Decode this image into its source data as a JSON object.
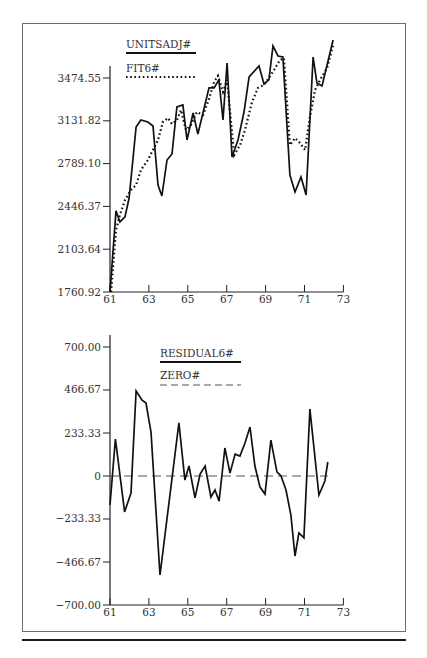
{
  "chart_data": [
    {
      "type": "line",
      "title": "",
      "xlabel": "",
      "ylabel": "",
      "xlim": [
        61,
        73
      ],
      "ylim": [
        1760.92,
        3817.28
      ],
      "grid": false,
      "legend_position": "top-left inside",
      "x_ticks": [
        "61",
        "63",
        "65",
        "67",
        "69",
        "71",
        "73"
      ],
      "y_ticks": [
        "1760.92",
        "2103.64",
        "2446.37",
        "2789.10",
        "3131.82",
        "3474.55"
      ],
      "series": [
        {
          "name": "UNITSADJ#",
          "style": "solid",
          "x": [
            61.0,
            61.31,
            61.51,
            61.77,
            61.98,
            62.34,
            62.59,
            62.95,
            63.21,
            63.47,
            63.67,
            63.93,
            64.19,
            64.44,
            64.75,
            64.96,
            65.27,
            65.52,
            66.09,
            66.35,
            66.6,
            66.81,
            67.02,
            67.27,
            67.58,
            67.89,
            68.15,
            68.66,
            68.92,
            69.17,
            69.38,
            69.64,
            69.89,
            70.25,
            70.51,
            70.82,
            71.08,
            71.44,
            71.64,
            71.9,
            72.47
          ],
          "values": [
            1761,
            2410,
            2322,
            2362,
            2514,
            3082,
            3138,
            3122,
            3090,
            2618,
            2530,
            2818,
            2866,
            3242,
            3258,
            2978,
            3194,
            3026,
            3395,
            3395,
            3459,
            3138,
            3595,
            2842,
            2978,
            3202,
            3483,
            3571,
            3427,
            3459,
            3731,
            3651,
            3643,
            2698,
            2562,
            2682,
            2538,
            3643,
            3435,
            3411,
            3779
          ]
        },
        {
          "name": "FIT6#",
          "style": "dotted",
          "x": [
            61.05,
            61.31,
            61.51,
            61.77,
            62.08,
            62.34,
            62.59,
            62.95,
            63.26,
            63.47,
            63.72,
            63.98,
            64.19,
            64.44,
            64.65,
            64.9,
            65.16,
            65.47,
            65.78,
            66.09,
            66.35,
            66.55,
            66.81,
            67.02,
            67.38,
            67.69,
            67.94,
            68.3,
            68.61,
            68.92,
            69.17,
            69.43,
            69.74,
            69.94,
            70.25,
            70.51,
            70.77,
            71.03,
            71.28,
            71.54,
            71.8,
            72.16,
            72.47
          ],
          "values": [
            1761,
            2258,
            2378,
            2498,
            2578,
            2618,
            2738,
            2818,
            2914,
            2978,
            3122,
            3154,
            3106,
            3138,
            3218,
            3058,
            3098,
            3202,
            3178,
            3306,
            3443,
            3491,
            3363,
            3459,
            2858,
            2938,
            3058,
            3282,
            3395,
            3419,
            3475,
            3539,
            3619,
            3635,
            2938,
            2994,
            2954,
            2898,
            3162,
            3378,
            3459,
            3555,
            3739
          ]
        }
      ]
    },
    {
      "type": "line",
      "title": "",
      "xlabel": "",
      "ylabel": "",
      "xlim": [
        61,
        73
      ],
      "ylim": [
        -700.0,
        700.0
      ],
      "grid": false,
      "legend_position": "top-center inside",
      "x_ticks": [
        "61",
        "63",
        "65",
        "67",
        "69",
        "71",
        "73"
      ],
      "y_ticks": [
        "-700.00",
        "-466.67",
        "-233.33",
        "0",
        "233.33",
        "466.67",
        "700.00"
      ],
      "series": [
        {
          "name": "RESIDUAL6#",
          "style": "solid",
          "x": [
            61.0,
            61.28,
            61.75,
            62.08,
            62.34,
            62.65,
            62.85,
            63.11,
            63.57,
            64.54,
            64.85,
            65.06,
            65.37,
            65.63,
            65.89,
            66.19,
            66.4,
            66.61,
            66.91,
            67.17,
            67.43,
            67.68,
            67.94,
            68.2,
            68.45,
            68.71,
            68.97,
            69.27,
            69.58,
            69.79,
            70.05,
            70.3,
            70.51,
            70.71,
            70.97,
            71.28,
            71.74,
            72.05,
            72.2
          ],
          "values": [
            -157,
            201,
            -195,
            -92,
            461,
            412,
            396,
            239,
            -537,
            288,
            -22,
            54,
            -119,
            11,
            54,
            -114,
            -76,
            -136,
            152,
            16,
            119,
            108,
            179,
            266,
            54,
            -60,
            -98,
            195,
            22,
            0,
            -76,
            -212,
            -434,
            -309,
            -336,
            363,
            -103,
            -27,
            76
          ]
        },
        {
          "name": "ZERO#",
          "style": "dashed",
          "x": [
            61,
            72.2
          ],
          "values": [
            0,
            0
          ]
        }
      ]
    }
  ],
  "top_chart": {
    "legend": {
      "solid_label": "UNITSADJ#",
      "dotted_label": "FIT6#"
    },
    "y_ticks": [
      "3474.55",
      "3131.82",
      "2789.10",
      "2446.37",
      "2103.64",
      "1760.92"
    ],
    "x_ticks": [
      "61",
      "63",
      "65",
      "67",
      "69",
      "71",
      "73"
    ]
  },
  "bottom_chart": {
    "legend": {
      "solid_label": "RESIDUAL6#",
      "dashed_label": "ZERO#"
    },
    "y_ticks": [
      "700.00",
      "466.67",
      "233.33",
      "0",
      "−233.33",
      "−466.67",
      "−700.00"
    ],
    "x_ticks": [
      "61",
      "63",
      "65",
      "67",
      "69",
      "71",
      "73"
    ]
  }
}
